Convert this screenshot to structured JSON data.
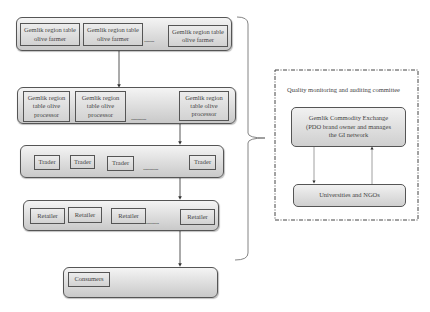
{
  "chain": {
    "farmers": {
      "items": [
        "Gemlik region table olive farmer",
        "Gemlik region table olive farmer",
        "Gemlik region table olive farmer"
      ],
      "ellipsis": "........"
    },
    "processors": {
      "items": [
        "Gemlik region table olive processor",
        "Gemlik region table olive processor",
        "Gemlik region table olive processor"
      ],
      "ellipsis": "............"
    },
    "traders": {
      "items": [
        "Trader",
        "Trader",
        "Trader",
        "Trader"
      ],
      "ellipsis": "............"
    },
    "retailers": {
      "items": [
        "Retailer",
        "Retailer",
        "Retailer",
        "Retailer"
      ],
      "ellipsis": "..........."
    },
    "consumers": {
      "items": [
        "Consumers"
      ]
    }
  },
  "committee": {
    "title": "Quality monitoring and auditing committee",
    "exchange": "Gemlik Commodity Exchange (PDO brand owner and manages the GI network",
    "universities": "Universities and NGOs"
  }
}
